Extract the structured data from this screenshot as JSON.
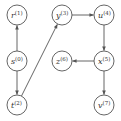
{
  "diagram": {
    "type": "directed-graph",
    "nodes": [
      {
        "id": "s",
        "label": "s",
        "index": "(0)",
        "x": 17,
        "y": 61
      },
      {
        "id": "r",
        "label": "r",
        "index": "(1)",
        "x": 17,
        "y": 15
      },
      {
        "id": "t",
        "label": "t",
        "index": "(2)",
        "x": 17,
        "y": 105
      },
      {
        "id": "y",
        "label": "y",
        "index": "(3)",
        "x": 62,
        "y": 15
      },
      {
        "id": "u",
        "label": "u",
        "index": "(4)",
        "x": 104,
        "y": 15
      },
      {
        "id": "x",
        "label": "x",
        "index": "(5)",
        "x": 104,
        "y": 61
      },
      {
        "id": "z",
        "label": "z",
        "index": "(6)",
        "x": 62,
        "y": 61
      },
      {
        "id": "v",
        "label": "v",
        "index": "(7)",
        "x": 104,
        "y": 105
      }
    ],
    "edges": [
      {
        "from": "s",
        "to": "r"
      },
      {
        "from": "s",
        "to": "t"
      },
      {
        "from": "t",
        "to": "y"
      },
      {
        "from": "y",
        "to": "u"
      },
      {
        "from": "u",
        "to": "x"
      },
      {
        "from": "x",
        "to": "z"
      },
      {
        "from": "x",
        "to": "v"
      }
    ],
    "colors": {
      "stroke": "#555555",
      "text": "#333333",
      "background": "#ffffff"
    }
  }
}
